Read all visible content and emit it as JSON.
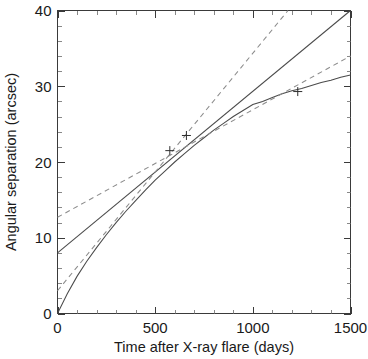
{
  "chart_data": {
    "type": "line",
    "title": "",
    "xlabel": "Time after X-ray flare (days)",
    "ylabel": "Angular separation (arcsec)",
    "xlim": [
      0,
      1500
    ],
    "ylim": [
      0,
      40
    ],
    "xticks": [
      0,
      500,
      1000,
      1500
    ],
    "yticks": [
      0,
      10,
      20,
      30,
      40
    ],
    "xtick_labels": [
      "0",
      "500",
      "1000",
      "1500"
    ],
    "ytick_labels": [
      "0",
      "10",
      "20",
      "30",
      "40"
    ],
    "x_minor_tick_step": 100,
    "y_minor_tick_step": 2,
    "grid": false,
    "legend": "none",
    "frame": "box",
    "series": [
      {
        "name": "decelerating-expansion-model",
        "style": "solid",
        "color": "#4a4a4a",
        "x": [
          0,
          50,
          100,
          150,
          200,
          250,
          300,
          350,
          400,
          450,
          500,
          550,
          600,
          650,
          700,
          750,
          800,
          850,
          900,
          950,
          1000,
          1050,
          1100,
          1150,
          1200,
          1250,
          1300,
          1350,
          1400,
          1450,
          1500
        ],
        "y": [
          0.0,
          2.6,
          4.9,
          6.9,
          8.7,
          10.4,
          12.0,
          13.5,
          14.9,
          16.3,
          17.6,
          18.8,
          20.0,
          21.1,
          22.2,
          23.2,
          24.2,
          25.1,
          26.0,
          26.8,
          27.6,
          28.0,
          28.5,
          29.0,
          29.4,
          29.7,
          30.1,
          30.5,
          30.8,
          31.2,
          31.5
        ]
      },
      {
        "name": "constant-velocity-model",
        "style": "solid",
        "color": "#4a4a4a",
        "x": [
          0,
          1500
        ],
        "y": [
          8.0,
          40.0
        ]
      },
      {
        "name": "upper-bound-model",
        "style": "dashed",
        "color": "#8c8c8c",
        "x": [
          0,
          1180
        ],
        "y": [
          3.0,
          40.0
        ]
      },
      {
        "name": "lower-bound-model",
        "style": "dashed",
        "color": "#8c8c8c",
        "x": [
          0,
          1500
        ],
        "y": [
          12.7,
          34.0
        ]
      }
    ],
    "data_points": [
      {
        "x": 575,
        "y": 21.5,
        "marker": "plus"
      },
      {
        "x": 660,
        "y": 23.5,
        "marker": "plus"
      },
      {
        "x": 1230,
        "y": 29.3,
        "marker": "plus"
      }
    ]
  }
}
